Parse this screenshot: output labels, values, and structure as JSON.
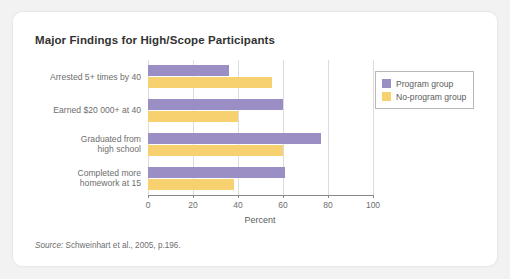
{
  "chart_data": {
    "type": "bar",
    "orientation": "horizontal",
    "title": "Major Findings for High/Scope Participants",
    "xlabel": "Percent",
    "ylabel": "",
    "xlim": [
      0,
      100
    ],
    "xticks": [
      0,
      20,
      40,
      60,
      80,
      100
    ],
    "grid": "vertical",
    "legend_position": "top-right",
    "categories": [
      "Arrested 5+ times by 40",
      "Earned $20 000+ at 40",
      "Graduated from\nhigh school",
      "Completed more\nhomework at 15"
    ],
    "series": [
      {
        "name": "Program group",
        "color": "#9b8ec4",
        "values": [
          36,
          60,
          77,
          61
        ]
      },
      {
        "name": "No-program group",
        "color": "#f7d070",
        "values": [
          55,
          40,
          60,
          38
        ]
      }
    ],
    "source": "Source: Schweinhart et al., 2005, p.196.",
    "source_prefix": "Source:",
    "source_rest": " Schweinhart et al., 2005, p.196."
  },
  "colors": {
    "program_group": "#9b8ec4",
    "no_program_group": "#f7d070",
    "gridline": "#dcdcdc",
    "axis": "#888888",
    "page_background": "#f2f2f2",
    "card_background": "#ffffff",
    "text": "#6e6e6e",
    "title_text": "#333333"
  }
}
